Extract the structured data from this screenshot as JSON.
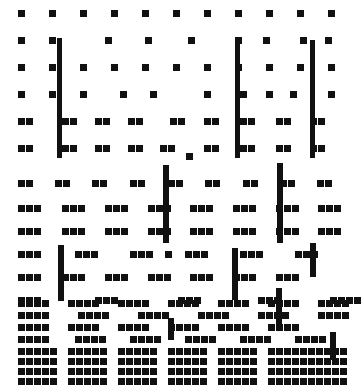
{
  "figure": {
    "type": "hinton-matrix",
    "width": 355,
    "height": 388,
    "background_color": "#ffffff",
    "mark_color": "#111111"
  },
  "chart_data": {
    "type": "heatmap",
    "title": "",
    "subtitle": "",
    "xlabel": "",
    "ylabel": "",
    "grid": false,
    "legend": "none",
    "cell_size": 7,
    "cell_gap": 1,
    "xlim": [
      0,
      355
    ],
    "ylim": [
      0,
      388
    ],
    "rows": [
      {
        "y": 10,
        "run": 1,
        "xs": [
          18,
          49,
          80,
          111,
          142,
          173,
          204,
          235,
          266,
          297,
          328
        ]
      },
      {
        "y": 37,
        "run": 1,
        "xs": [
          18,
          49,
          105,
          145,
          188,
          235,
          263,
          300,
          325
        ]
      },
      {
        "y": 64,
        "run": 1,
        "xs": [
          18,
          49,
          80,
          111,
          142,
          173,
          204,
          235,
          266,
          297,
          328
        ]
      },
      {
        "y": 91,
        "run": 1,
        "xs": [
          18,
          49,
          80,
          120,
          150,
          204,
          240,
          266,
          290,
          328
        ]
      },
      {
        "y": 118,
        "run": 2,
        "xs": [
          18,
          62,
          95,
          128,
          170,
          204,
          240,
          276,
          310
        ]
      },
      {
        "y": 145,
        "run": 2,
        "xs": [
          18,
          62,
          95,
          128,
          160,
          204,
          240,
          276,
          310
        ]
      },
      {
        "y": 153,
        "run": 1,
        "xs": [
          186
        ]
      },
      {
        "y": 180,
        "run": 2,
        "xs": [
          18,
          55,
          92,
          130,
          168,
          205,
          243,
          280,
          317
        ]
      },
      {
        "y": 205,
        "run": 3,
        "xs": [
          18,
          62,
          105,
          148,
          190,
          233,
          276,
          318
        ]
      },
      {
        "y": 228,
        "run": 3,
        "xs": [
          18,
          62,
          105,
          148,
          190,
          233,
          276,
          318
        ]
      },
      {
        "y": 251,
        "run": 3,
        "xs": [
          18,
          75,
          130,
          185,
          240,
          295
        ]
      },
      {
        "y": 251,
        "run": 1,
        "xs": [
          165
        ]
      },
      {
        "y": 274,
        "run": 3,
        "xs": [
          18,
          62,
          105,
          148,
          190,
          233,
          276
        ]
      },
      {
        "y": 297,
        "run": 3,
        "xs": [
          18,
          95,
          178,
          258
        ]
      },
      {
        "y": 297,
        "run": 4,
        "xs": [
          330
        ]
      },
      {
        "y": 300,
        "run": 4,
        "xs": [
          18,
          68,
          118,
          168,
          218,
          268,
          318
        ]
      },
      {
        "y": 312,
        "run": 4,
        "xs": [
          18,
          78,
          138,
          198,
          258,
          318
        ]
      },
      {
        "y": 324,
        "run": 4,
        "xs": [
          18,
          68,
          118,
          168,
          218,
          268
        ]
      },
      {
        "y": 336,
        "run": 4,
        "xs": [
          18,
          75,
          130,
          185,
          240,
          295
        ]
      },
      {
        "y": 348,
        "run": 5,
        "xs": [
          18,
          68,
          118,
          168,
          218,
          268,
          308
        ]
      },
      {
        "y": 358,
        "run": 5,
        "xs": [
          18,
          68,
          118,
          168,
          218,
          268,
          308
        ]
      },
      {
        "y": 368,
        "run": 5,
        "xs": [
          18,
          68,
          118,
          168,
          218,
          268,
          308
        ]
      },
      {
        "y": 378,
        "run": 5,
        "xs": [
          18,
          68,
          118,
          168,
          218,
          268,
          308
        ]
      }
    ],
    "bars": [
      {
        "x": 57,
        "y": 38,
        "w": 5,
        "h": 120
      },
      {
        "x": 235,
        "y": 40,
        "w": 5,
        "h": 118
      },
      {
        "x": 310,
        "y": 40,
        "w": 5,
        "h": 118
      },
      {
        "x": 163,
        "y": 165,
        "w": 6,
        "h": 78
      },
      {
        "x": 277,
        "y": 163,
        "w": 6,
        "h": 80
      },
      {
        "x": 58,
        "y": 245,
        "w": 6,
        "h": 56
      },
      {
        "x": 232,
        "y": 248,
        "w": 6,
        "h": 52
      },
      {
        "x": 310,
        "y": 243,
        "w": 6,
        "h": 34
      },
      {
        "x": 168,
        "y": 318,
        "w": 6,
        "h": 22
      },
      {
        "x": 276,
        "y": 288,
        "w": 6,
        "h": 38
      },
      {
        "x": 330,
        "y": 332,
        "w": 6,
        "h": 28
      }
    ],
    "summary": {
      "row_count": 23,
      "bar_count": 11,
      "density_trend": "increasing downward"
    }
  }
}
